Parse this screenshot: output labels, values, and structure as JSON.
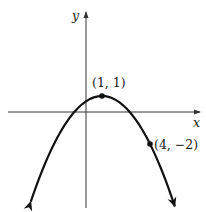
{
  "chart_data": {
    "type": "line",
    "title": "",
    "xlabel": "x",
    "ylabel": "y",
    "grid": false,
    "legend": null,
    "function": "y = -(1/3)(x - 1)^2 + 1",
    "curve_shape": "downward-opening parabola with arrowheads on both ends",
    "labeled_points": [
      {
        "x": 1,
        "y": 1,
        "label": "(1, 1)",
        "role": "vertex"
      },
      {
        "x": 4,
        "y": -2,
        "label": "(4, -2)",
        "role": "point on curve"
      }
    ],
    "x_range_approx": [
      -4.9,
      7.2
    ],
    "y_range_approx": [
      -6,
      6.3
    ],
    "axes": {
      "x_arrow": true,
      "y_arrow": true
    }
  },
  "labels": {
    "x_axis": "x",
    "y_axis": "y",
    "vertex": "(1, 1)",
    "point": "(4, −2)"
  },
  "colors": {
    "curve": "#111111",
    "axes": "#333333",
    "background": "#ffffff"
  }
}
